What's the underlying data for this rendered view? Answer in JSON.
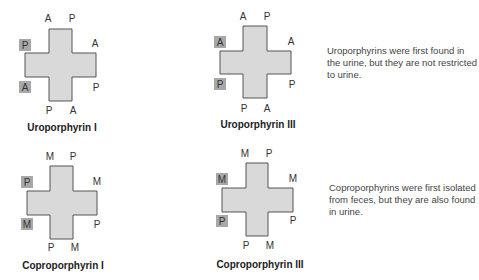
{
  "colors": {
    "cross_fill": "#d9d9d9",
    "cross_stroke": "#555555",
    "highlight_box": "#a8a8a8",
    "text": "#333333"
  },
  "structures": [
    {
      "title": "Uroporphyrin I",
      "labels": {
        "top_left": "A",
        "top_right": "P",
        "left_upper": "P",
        "right_upper": "A",
        "left_lower": "A",
        "right_lower": "P",
        "bottom_left": "P",
        "bottom_right": "A"
      },
      "highlighted": [
        "left_upper",
        "left_lower"
      ]
    },
    {
      "title": "Uroporphyrin III",
      "labels": {
        "top_left": "A",
        "top_right": "P",
        "left_upper": "A",
        "right_upper": "A",
        "left_lower": "P",
        "right_lower": "P",
        "bottom_left": "P",
        "bottom_right": "A"
      },
      "highlighted": [
        "left_upper",
        "left_lower"
      ]
    },
    {
      "title": "Coproporphyrin I",
      "labels": {
        "top_left": "M",
        "top_right": "P",
        "left_upper": "P",
        "right_upper": "M",
        "left_lower": "M",
        "right_lower": "P",
        "bottom_left": "P",
        "bottom_right": "M"
      },
      "highlighted": [
        "left_upper",
        "left_lower"
      ]
    },
    {
      "title": "Coproporphyrin III",
      "labels": {
        "top_left": "M",
        "top_right": "P",
        "left_upper": "M",
        "right_upper": "M",
        "left_lower": "P",
        "right_lower": "P",
        "bottom_left": "P",
        "bottom_right": "M"
      },
      "highlighted": [
        "left_upper",
        "left_lower"
      ]
    }
  ],
  "notes": {
    "uroporphyrins": "Uroporphyrins were first found in the urine, but they are not restricted to urine.",
    "coproporphyrins": "Coproporphyrins were first isolated from feces, but they are also found in urine."
  }
}
